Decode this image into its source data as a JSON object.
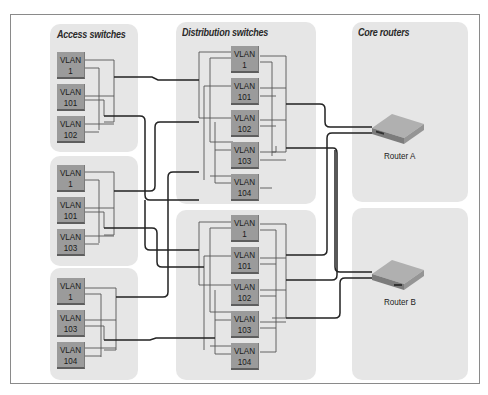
{
  "columns": {
    "access": {
      "title": "Access switches"
    },
    "distribution": {
      "title": "Distribution switches"
    },
    "core": {
      "title": "Core routers"
    }
  },
  "access_groups": [
    {
      "vlans": [
        {
          "l1": "VLAN",
          "l2": "1"
        },
        {
          "l1": "VLAN",
          "l2": "101"
        },
        {
          "l1": "VLAN",
          "l2": "102"
        }
      ]
    },
    {
      "vlans": [
        {
          "l1": "VLAN",
          "l2": "1"
        },
        {
          "l1": "VLAN",
          "l2": "101"
        },
        {
          "l1": "VLAN",
          "l2": "103"
        }
      ]
    },
    {
      "vlans": [
        {
          "l1": "VLAN",
          "l2": "1"
        },
        {
          "l1": "VLAN",
          "l2": "103"
        },
        {
          "l1": "VLAN",
          "l2": "104"
        }
      ]
    }
  ],
  "distribution_groups": [
    {
      "vlans": [
        {
          "l1": "VLAN",
          "l2": "1"
        },
        {
          "l1": "VLAN",
          "l2": "101"
        },
        {
          "l1": "VLAN",
          "l2": "102"
        },
        {
          "l1": "VLAN",
          "l2": "103"
        },
        {
          "l1": "VLAN",
          "l2": "104"
        }
      ]
    },
    {
      "vlans": [
        {
          "l1": "VLAN",
          "l2": "1"
        },
        {
          "l1": "VLAN",
          "l2": "101"
        },
        {
          "l1": "VLAN",
          "l2": "102"
        },
        {
          "l1": "VLAN",
          "l2": "103"
        },
        {
          "l1": "VLAN",
          "l2": "104"
        }
      ]
    }
  ],
  "routers": [
    {
      "label": "Router A"
    },
    {
      "label": "Router B"
    }
  ],
  "colors": {
    "panel": "#e6e6e6",
    "vlan_box": "#9b9b9b",
    "wire": "#333333",
    "frame": "#8a8a8a"
  }
}
